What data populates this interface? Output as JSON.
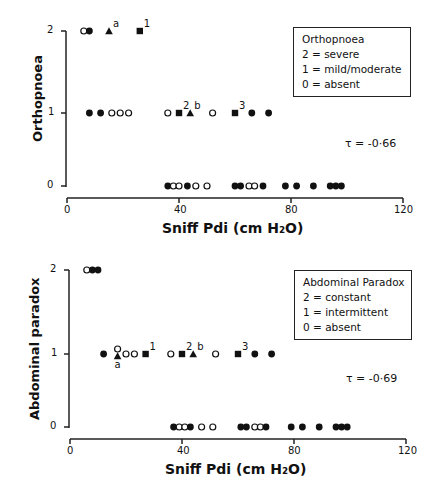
{
  "chart_data": [
    {
      "type": "scatter",
      "title": "",
      "xlabel": "Sniff Pdi (cm H2O)",
      "ylabel": "Orthopnoea",
      "xlim": [
        0,
        120
      ],
      "ylim": [
        0,
        2
      ],
      "xticks": [
        0,
        40,
        80,
        120
      ],
      "yticks": [
        0,
        1,
        2
      ],
      "grid": false,
      "legend": {
        "title": "Orthopnoea",
        "entries": [
          "2 = severe",
          "1 = mild/moderate",
          "0 = absent"
        ],
        "position": "upper right"
      },
      "annotation": "τ = -0·66",
      "points": [
        {
          "x": 6,
          "y": 2,
          "marker": "open-circle"
        },
        {
          "x": 8,
          "y": 2,
          "marker": "filled-circle"
        },
        {
          "x": 15,
          "y": 2,
          "marker": "triangle",
          "label": "a"
        },
        {
          "x": 26,
          "y": 2,
          "marker": "square",
          "label": "1"
        },
        {
          "x": 8,
          "y": 1,
          "marker": "filled-circle"
        },
        {
          "x": 12,
          "y": 1,
          "marker": "filled-circle"
        },
        {
          "x": 16,
          "y": 1,
          "marker": "open-circle"
        },
        {
          "x": 19,
          "y": 1,
          "marker": "open-circle"
        },
        {
          "x": 22,
          "y": 1,
          "marker": "open-circle"
        },
        {
          "x": 36,
          "y": 1,
          "marker": "open-circle"
        },
        {
          "x": 40,
          "y": 1,
          "marker": "square",
          "label": "2"
        },
        {
          "x": 44,
          "y": 1,
          "marker": "triangle",
          "label": "b"
        },
        {
          "x": 52,
          "y": 1,
          "marker": "open-circle"
        },
        {
          "x": 60,
          "y": 1,
          "marker": "square",
          "label": "3"
        },
        {
          "x": 66,
          "y": 1,
          "marker": "filled-circle"
        },
        {
          "x": 72,
          "y": 1,
          "marker": "filled-circle"
        },
        {
          "x": 36,
          "y": 0,
          "marker": "filled-circle"
        },
        {
          "x": 38,
          "y": 0,
          "marker": "open-circle"
        },
        {
          "x": 40,
          "y": 0,
          "marker": "open-circle"
        },
        {
          "x": 43,
          "y": 0,
          "marker": "filled-circle"
        },
        {
          "x": 46,
          "y": 0,
          "marker": "open-circle"
        },
        {
          "x": 50,
          "y": 0,
          "marker": "open-circle"
        },
        {
          "x": 60,
          "y": 0,
          "marker": "filled-circle"
        },
        {
          "x": 62,
          "y": 0,
          "marker": "filled-circle"
        },
        {
          "x": 65,
          "y": 0,
          "marker": "open-circle"
        },
        {
          "x": 67,
          "y": 0,
          "marker": "open-circle"
        },
        {
          "x": 70,
          "y": 0,
          "marker": "filled-circle"
        },
        {
          "x": 78,
          "y": 0,
          "marker": "filled-circle"
        },
        {
          "x": 82,
          "y": 0,
          "marker": "filled-circle"
        },
        {
          "x": 88,
          "y": 0,
          "marker": "filled-circle"
        },
        {
          "x": 94,
          "y": 0,
          "marker": "filled-circle"
        },
        {
          "x": 96,
          "y": 0,
          "marker": "filled-circle"
        },
        {
          "x": 98,
          "y": 0,
          "marker": "filled-circle"
        }
      ]
    },
    {
      "type": "scatter",
      "title": "",
      "xlabel": "Sniff Pdi (cm H2O)",
      "ylabel": "Abdominal paradox",
      "xlim": [
        0,
        120
      ],
      "ylim": [
        0,
        2
      ],
      "xticks": [
        0,
        40,
        80,
        120
      ],
      "yticks": [
        0,
        1,
        2
      ],
      "grid": false,
      "legend": {
        "title": "Abdominal Paradox",
        "entries": [
          "2 = constant",
          "1 = intermittent",
          "0 = absent"
        ],
        "position": "upper right"
      },
      "annotation": "τ = -0·69",
      "points": [
        {
          "x": 6,
          "y": 2,
          "marker": "open-circle"
        },
        {
          "x": 8,
          "y": 2,
          "marker": "filled-circle"
        },
        {
          "x": 10,
          "y": 2,
          "marker": "filled-circle"
        },
        {
          "x": 12,
          "y": 1,
          "marker": "filled-circle"
        },
        {
          "x": 17,
          "y": 1,
          "marker": "open-circle"
        },
        {
          "x": 17,
          "y": 1,
          "marker": "triangle",
          "label": "a"
        },
        {
          "x": 20,
          "y": 1,
          "marker": "open-circle"
        },
        {
          "x": 23,
          "y": 1,
          "marker": "open-circle"
        },
        {
          "x": 27,
          "y": 1,
          "marker": "square",
          "label": "1"
        },
        {
          "x": 36,
          "y": 1,
          "marker": "open-circle"
        },
        {
          "x": 40,
          "y": 1,
          "marker": "square",
          "label": "2"
        },
        {
          "x": 44,
          "y": 1,
          "marker": "triangle",
          "label": "b"
        },
        {
          "x": 52,
          "y": 1,
          "marker": "open-circle"
        },
        {
          "x": 60,
          "y": 1,
          "marker": "square",
          "label": "3"
        },
        {
          "x": 66,
          "y": 1,
          "marker": "filled-circle"
        },
        {
          "x": 72,
          "y": 1,
          "marker": "filled-circle"
        },
        {
          "x": 37,
          "y": 0,
          "marker": "filled-circle"
        },
        {
          "x": 39,
          "y": 0,
          "marker": "open-circle"
        },
        {
          "x": 41,
          "y": 0,
          "marker": "open-circle"
        },
        {
          "x": 43,
          "y": 0,
          "marker": "filled-circle"
        },
        {
          "x": 47,
          "y": 0,
          "marker": "open-circle"
        },
        {
          "x": 51,
          "y": 0,
          "marker": "open-circle"
        },
        {
          "x": 61,
          "y": 0,
          "marker": "filled-circle"
        },
        {
          "x": 63,
          "y": 0,
          "marker": "filled-circle"
        },
        {
          "x": 66,
          "y": 0,
          "marker": "open-circle"
        },
        {
          "x": 68,
          "y": 0,
          "marker": "open-circle"
        },
        {
          "x": 70,
          "y": 0,
          "marker": "filled-circle"
        },
        {
          "x": 79,
          "y": 0,
          "marker": "filled-circle"
        },
        {
          "x": 83,
          "y": 0,
          "marker": "filled-circle"
        },
        {
          "x": 89,
          "y": 0,
          "marker": "filled-circle"
        },
        {
          "x": 95,
          "y": 0,
          "marker": "filled-circle"
        },
        {
          "x": 97,
          "y": 0,
          "marker": "filled-circle"
        },
        {
          "x": 99,
          "y": 0,
          "marker": "filled-circle"
        }
      ]
    }
  ],
  "panels": [
    {
      "ylabel": "Orthopnoea",
      "xlabel": "Sniff Pdi (cm H₂O)",
      "legend_title": "Orthopnoea",
      "legend_lines": [
        "2 = severe",
        "1 = mild/moderate",
        "0 = absent"
      ],
      "tau": "τ = -0·66",
      "yticks": [
        "2",
        "1",
        "0"
      ],
      "xticks": [
        "0",
        "40",
        "80",
        "120"
      ]
    },
    {
      "ylabel": "Abdominal paradox",
      "xlabel": "Sniff Pdi (cm H₂O)",
      "legend_title": "Abdominal Paradox",
      "legend_lines": [
        "2 = constant",
        "1 = intermittent",
        "0 = absent"
      ],
      "tau": "τ = -0·69",
      "yticks": [
        "2",
        "1",
        "0"
      ],
      "xticks": [
        "0",
        "40",
        "80",
        "120"
      ]
    }
  ]
}
